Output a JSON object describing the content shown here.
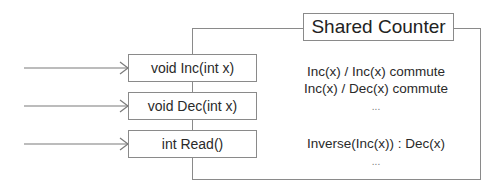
{
  "diagram": {
    "object": {
      "title": "Shared Counter"
    },
    "methods": [
      {
        "signature": "void Inc(int x)"
      },
      {
        "signature": "void Dec(int x)"
      },
      {
        "signature": "int Read()"
      }
    ],
    "properties": {
      "commutativity": [
        "Inc(x) / Inc(x) commute",
        "Inc(x) / Dec(x) commute",
        "..."
      ],
      "inverses": [
        "Inverse(Inc(x)) : Dec(x)",
        "..."
      ]
    },
    "colors": {
      "stroke": "#8a8a8a",
      "arrow": "#7a7a7a",
      "text": "#2a2a2a"
    }
  }
}
